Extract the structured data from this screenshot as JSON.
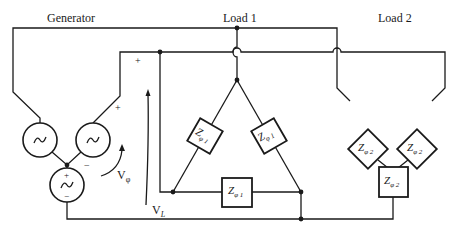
{
  "labels": {
    "generator": "Generator",
    "load1": "Load 1",
    "load2": "Load 2"
  },
  "voltages": {
    "phase": {
      "main": "V",
      "sub": "φ"
    },
    "line": {
      "main": "V",
      "sub": "L"
    }
  },
  "polarity": {
    "plus": "+",
    "minus": "−"
  },
  "impedances": {
    "load1": {
      "main": "Z",
      "sub": "φ",
      "idx": "1"
    },
    "load2": {
      "main": "Z",
      "sub": "φ",
      "idx": "2"
    }
  },
  "colors": {
    "line": "#1a1a1a",
    "background": "#ffffff"
  }
}
